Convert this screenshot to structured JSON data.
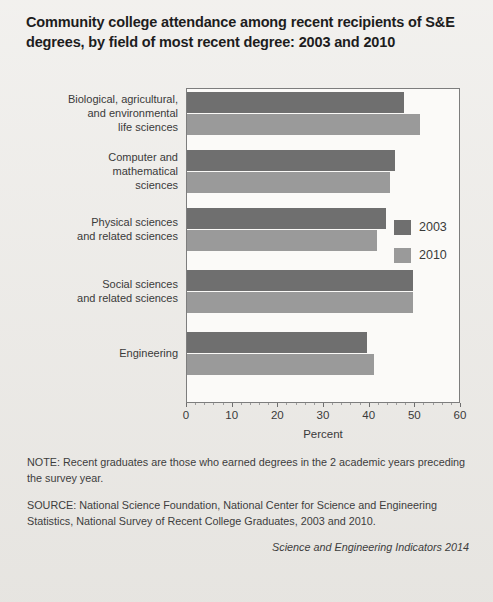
{
  "title": "Community college attendance among recent recipients of S&E degrees, by field of most recent degree: 2003 and 2010",
  "legend": {
    "items": [
      {
        "label": "2003",
        "color": "#6f6f6f"
      },
      {
        "label": "2010",
        "color": "#9a9a9a"
      }
    ]
  },
  "axis": {
    "title": "Percent",
    "ticks": [
      "0",
      "10",
      "20",
      "30",
      "40",
      "50",
      "60"
    ]
  },
  "notes": {
    "note": "NOTE: Recent graduates are those who earned degrees in the 2 academic years preceding the survey year.",
    "source": "SOURCE: National Science Foundation, National Center for Science and Engineering Statistics, National Survey of Recent College Graduates, 2003 and 2010.",
    "credit": "Science and Engineering Indicators 2014"
  },
  "chart_data": {
    "type": "bar",
    "orientation": "horizontal",
    "title": "Community college attendance among recent recipients of S&E degrees, by field of most recent degree: 2003 and 2010",
    "xlabel": "Percent",
    "ylabel": "",
    "xlim": [
      0,
      60
    ],
    "xticks": [
      0,
      10,
      20,
      30,
      40,
      50,
      60
    ],
    "grid": false,
    "legend_position": "inside-right",
    "categories": [
      "Biological, agricultural, and environmental life sciences",
      "Computer and mathematical sciences",
      "Physical sciences and related sciences",
      "Social sciences and related sciences",
      "Engineering"
    ],
    "category_lines": [
      [
        "Biological, agricultural,",
        "and environmental",
        "life sciences"
      ],
      [
        "Computer and",
        "mathematical",
        "sciences"
      ],
      [
        "Physical sciences",
        "and related sciences"
      ],
      [
        "Social sciences",
        "and related sciences"
      ],
      [
        "Engineering"
      ]
    ],
    "series": [
      {
        "name": "2003",
        "color": "#6f6f6f",
        "values": [
          47.5,
          45.5,
          43.5,
          49.5,
          39.5
        ]
      },
      {
        "name": "2010",
        "color": "#9a9a9a",
        "values": [
          51.0,
          44.5,
          41.5,
          49.5,
          41.0
        ]
      }
    ]
  }
}
